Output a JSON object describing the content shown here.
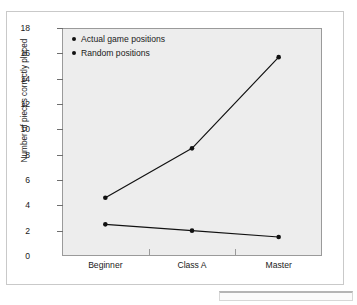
{
  "figure": {
    "frame_border_color": "#c9c9c9",
    "plot_background": "#ededed",
    "plot_border_color": "#9a9a9a",
    "series_color": "#111111"
  },
  "chart_data": {
    "type": "line",
    "title": "",
    "xlabel": "",
    "ylabel": "Number of pieces correctly placed",
    "categories": [
      "Beginner",
      "Class A",
      "Master"
    ],
    "ylim": [
      0,
      18
    ],
    "yticks": [
      0,
      2,
      4,
      6,
      8,
      10,
      12,
      14,
      16,
      18
    ],
    "ytick_labels": [
      "0",
      "2",
      "4",
      "6",
      "8",
      "10",
      "12",
      "14",
      "16",
      "18"
    ],
    "grid": false,
    "legend_position": "top-left-inside",
    "series": [
      {
        "name": "Actual game positions",
        "values": [
          4.6,
          8.5,
          15.7
        ],
        "marker": "circle",
        "color": "#111111"
      },
      {
        "name": "Random positions",
        "values": [
          2.5,
          2.0,
          1.5
        ],
        "marker": "circle",
        "color": "#111111"
      }
    ]
  },
  "legend": {
    "items": [
      {
        "label": "Actual game positions",
        "marker": "legend-dot"
      },
      {
        "label": "Random positions",
        "marker": "legend-dot"
      }
    ]
  }
}
